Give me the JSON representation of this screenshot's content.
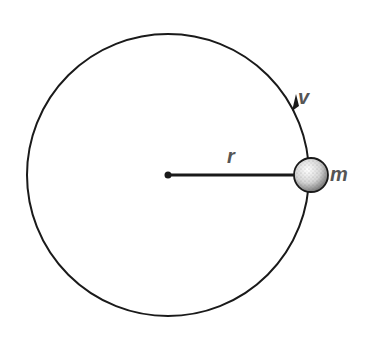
{
  "diagram": {
    "labels": {
      "radius": "r",
      "velocity": "v",
      "mass": "m"
    },
    "geometry": {
      "center": [
        168,
        175
      ],
      "orbit_radius": 141,
      "mass_radius": 17
    },
    "colors": {
      "line": "#1a1a1a",
      "label": "#555555",
      "background": "#ffffff"
    }
  }
}
